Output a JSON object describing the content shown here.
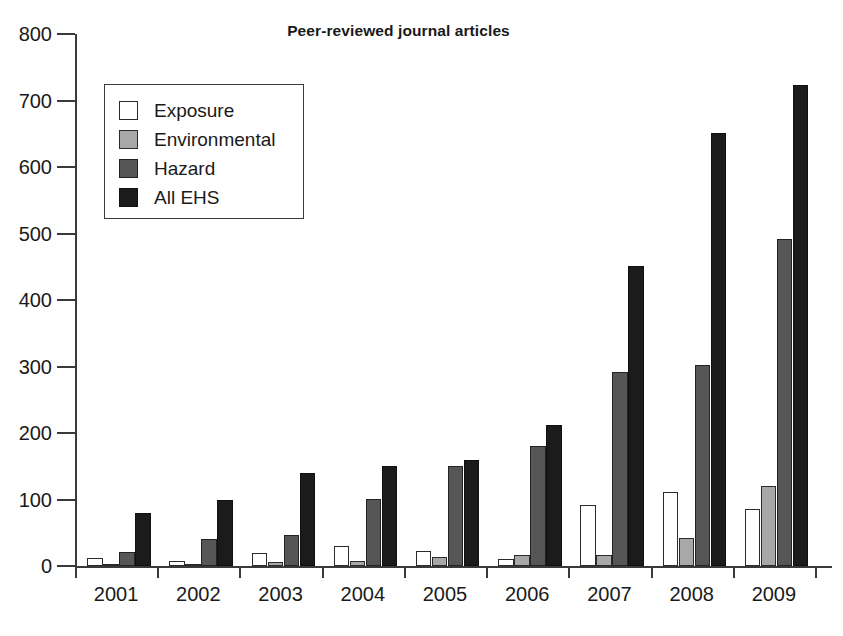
{
  "chart_data": {
    "type": "bar",
    "title": "Peer-reviewed journal articles",
    "xlabel": "",
    "ylabel": "",
    "ylim": [
      0,
      800
    ],
    "ytick_values": [
      0,
      100,
      200,
      300,
      400,
      500,
      600,
      700,
      800
    ],
    "ytick_labels": [
      "0",
      "100",
      "200",
      "300",
      "400",
      "500",
      "600",
      "700",
      "800"
    ],
    "grid": false,
    "legend_position": "upper left",
    "categories": [
      "2001",
      "2002",
      "2003",
      "2004",
      "2005",
      "2006",
      "2007",
      "2008",
      "2009"
    ],
    "series": [
      {
        "name": "Exposure",
        "color": "#ffffff",
        "values": [
          12,
          7,
          20,
          30,
          22,
          10,
          92,
          112,
          85
        ]
      },
      {
        "name": "Environmental",
        "color": "#a8a8a8",
        "values": [
          3,
          2,
          6,
          8,
          13,
          16,
          16,
          42,
          121
        ]
      },
      {
        "name": "Hazard",
        "color": "#565656",
        "values": [
          21,
          41,
          46,
          101,
          150,
          180,
          292,
          302,
          492
        ]
      },
      {
        "name": "All EHS",
        "color": "#1b1b1b",
        "values": [
          80,
          100,
          140,
          150,
          160,
          212,
          451,
          651,
          724
        ]
      }
    ]
  },
  "legend": {
    "items": [
      {
        "label": "Exposure",
        "swatch": "exposure"
      },
      {
        "label": "Environmental",
        "swatch": "environmental"
      },
      {
        "label": "Hazard",
        "swatch": "hazard"
      },
      {
        "label": "All EHS",
        "swatch": "allehs"
      }
    ]
  },
  "colors": {
    "axis": "#3a3a3a",
    "text": "#1a1a1a",
    "background": "#ffffff"
  }
}
